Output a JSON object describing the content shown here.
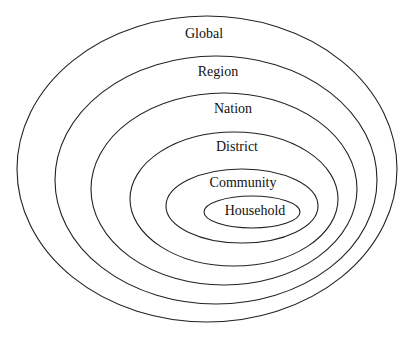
{
  "diagram": {
    "type": "nested-ellipses",
    "stroke_color": "#222222",
    "text_color": "#111111",
    "background": "#ffffff",
    "levels": [
      {
        "label": "Global",
        "cx": 207,
        "cy": 169,
        "rx": 190,
        "ry": 153,
        "lx": 204,
        "ly": 35
      },
      {
        "label": "Region",
        "cx": 216,
        "cy": 180,
        "rx": 161,
        "ry": 124,
        "lx": 218,
        "ly": 73
      },
      {
        "label": "Nation",
        "cx": 224,
        "cy": 189,
        "rx": 133,
        "ry": 96,
        "lx": 233,
        "ly": 110
      },
      {
        "label": "District",
        "cx": 234,
        "cy": 199,
        "rx": 104,
        "ry": 67,
        "lx": 237,
        "ly": 148
      },
      {
        "label": "Community",
        "cx": 242,
        "cy": 206,
        "rx": 76,
        "ry": 37,
        "lx": 243,
        "ly": 184
      },
      {
        "label": "Household",
        "cx": 252,
        "cy": 212,
        "rx": 48,
        "ry": 16,
        "lx": 255,
        "ly": 212
      }
    ]
  }
}
